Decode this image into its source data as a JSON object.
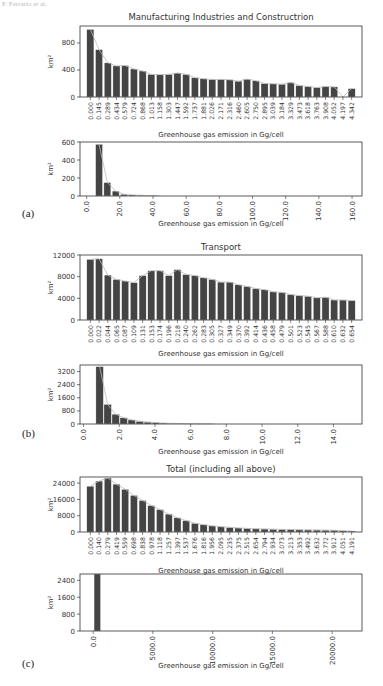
{
  "header": {
    "running_head": "F. Ferrario et al."
  },
  "panels": [
    {
      "label": "(a)"
    },
    {
      "label": "(b)"
    },
    {
      "label": "(c)"
    }
  ],
  "chart_data": [
    {
      "id": "a1",
      "type": "bar",
      "title": "Manufacturing Industries and Constructrion",
      "xlabel": "Greenhouse gas emission in Gg/cell",
      "ylabel": "km²",
      "ylim": [
        0,
        1050
      ],
      "yticks": [
        0,
        400,
        800
      ],
      "categories": [
        "0.000",
        "0.145",
        "0.289",
        "0.434",
        "0.579",
        "0.724",
        "0.868",
        "1.013",
        "1.158",
        "1.303",
        "1.447",
        "1.592",
        "1.737",
        "1.881",
        "2.026",
        "2.171",
        "2.316",
        "2.460",
        "2.605",
        "2.750",
        "2.895",
        "3.039",
        "3.184",
        "3.329",
        "3.473",
        "3.618",
        "3.763",
        "3.908",
        "4.052",
        "4.197",
        "4.342"
      ],
      "values": [
        1000,
        700,
        505,
        460,
        465,
        415,
        385,
        335,
        330,
        335,
        355,
        335,
        285,
        270,
        260,
        260,
        255,
        235,
        265,
        240,
        200,
        195,
        190,
        215,
        170,
        155,
        140,
        155,
        150,
        0,
        125
      ]
    },
    {
      "id": "a2",
      "type": "bar",
      "title": "",
      "xlabel": "Greenhouse gas emission in Gg/cell",
      "ylabel": "km²",
      "xlim": [
        -4,
        166
      ],
      "ylim": [
        0,
        600
      ],
      "yticks": [
        0,
        200,
        400,
        600
      ],
      "xticks": [
        "0.0",
        "20.0",
        "40.0",
        "60.0",
        "80.0",
        "100.0",
        "120.0",
        "140.0",
        "160.0"
      ],
      "bar_width": 4.2,
      "x": [
        7.5,
        12.5,
        17.5,
        22.5,
        27.5,
        32.5,
        37.5,
        42.5
      ],
      "values": [
        575,
        150,
        55,
        20,
        12,
        8,
        5,
        3
      ]
    },
    {
      "id": "b1",
      "type": "bar",
      "title": "Transport",
      "xlabel": "Greenhouse gas emission in Gg/cell",
      "ylabel": "km²",
      "ylim": [
        0,
        12000
      ],
      "yticks": [
        0,
        4000,
        8000,
        12000
      ],
      "categories": [
        "0.000",
        "0.022",
        "0.044",
        "0.065",
        "0.087",
        "0.109",
        "0.131",
        "0.153",
        "0.174",
        "0.196",
        "0.218",
        "0.240",
        "0.262",
        "0.283",
        "0.305",
        "0.327",
        "0.349",
        "0.370",
        "0.392",
        "0.414",
        "0.436",
        "0.458",
        "0.479",
        "0.501",
        "0.523",
        "0.545",
        "0.567",
        "0.588",
        "0.610",
        "0.632",
        "0.654"
      ],
      "values": [
        11200,
        11300,
        8300,
        7500,
        7200,
        6900,
        8200,
        9100,
        9100,
        8200,
        9300,
        8400,
        8200,
        7800,
        7500,
        7000,
        7000,
        6500,
        6200,
        5800,
        5600,
        5200,
        5100,
        4700,
        4500,
        4400,
        4100,
        4200,
        3700,
        3700,
        3600
      ]
    },
    {
      "id": "b2",
      "type": "bar",
      "title": "",
      "xlabel": "Greenhouse gas emission in Gg/cell",
      "ylabel": "km²",
      "xlim": [
        -0.2,
        15.6
      ],
      "ylim": [
        0,
        3600
      ],
      "yticks": [
        0,
        800,
        1600,
        2400,
        3200
      ],
      "xticks": [
        "0.0",
        "2.0",
        "4.0",
        "6.0",
        "8.0",
        "10.0",
        "12.0",
        "14.0"
      ],
      "bar_width": 0.42,
      "x": [
        0.9,
        1.35,
        1.8,
        2.25,
        2.7,
        3.15,
        3.6,
        4.05,
        4.5,
        4.95,
        5.4,
        5.85,
        6.3,
        6.75,
        7.2
      ],
      "values": [
        3500,
        1200,
        600,
        380,
        250,
        170,
        120,
        90,
        60,
        40,
        30,
        20,
        15,
        10,
        8
      ]
    },
    {
      "id": "c1",
      "type": "bar",
      "title": "Total (including all above)",
      "xlabel": "Greenhouse gas emission in Gg/cell",
      "ylabel": "km²",
      "ylim": [
        0,
        27000
      ],
      "yticks": [
        0,
        8000,
        16000,
        24000
      ],
      "categories": [
        "0.000",
        "0.140",
        "0.279",
        "0.419",
        "0.559",
        "0.698",
        "0.838",
        "0.978",
        "1.118",
        "1.257",
        "1.397",
        "1.537",
        "1.676",
        "1.816",
        "1.956",
        "2.095",
        "2.235",
        "2.375",
        "2.515",
        "2.654",
        "2.794",
        "2.934",
        "3.073",
        "3.213",
        "3.353",
        "3.492",
        "3.632",
        "3.772",
        "3.912",
        "4.051",
        "4.191"
      ],
      "values": [
        22500,
        25000,
        26500,
        23500,
        21000,
        18000,
        15500,
        13000,
        11000,
        8800,
        7000,
        5600,
        4300,
        3600,
        3000,
        2600,
        2300,
        2000,
        1800,
        1600,
        1500,
        1400,
        1300,
        1200,
        1100,
        1050,
        1000,
        950,
        900,
        600,
        500
      ]
    },
    {
      "id": "c2",
      "type": "bar",
      "title": "",
      "xlabel": "Greenhouse gas emission in Gg/cell",
      "ylabel": "km²",
      "xlim": [
        -1100,
        22500
      ],
      "ylim": [
        0,
        2700
      ],
      "yticks": [
        0,
        800,
        1600,
        2400
      ],
      "xticks": [
        "0.0",
        "5000.0",
        "10000.0",
        "15000.0",
        "20000.0"
      ],
      "bar_width": 550,
      "x": [
        350
      ],
      "values": [
        2700
      ]
    }
  ]
}
